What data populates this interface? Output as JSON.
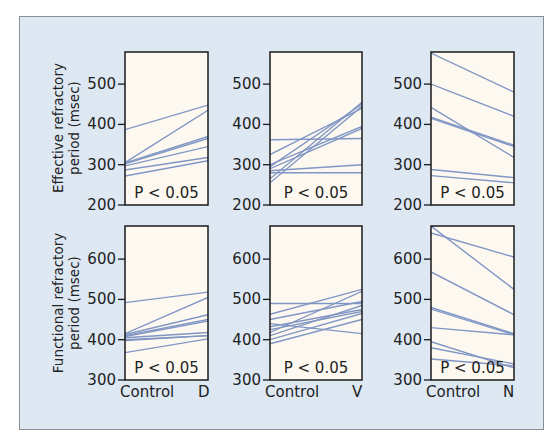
{
  "chart_data": [
    {
      "type": "line",
      "panel": "top-left",
      "ylabel": "Effective refractory period (msec)",
      "xlabel": "",
      "categories": [
        "Control",
        "D"
      ],
      "yticks": [
        200,
        300,
        400,
        500
      ],
      "ylim": [
        200,
        577
      ],
      "annotation": "P < 0.05",
      "series": [
        {
          "values": [
            387,
            448
          ]
        },
        {
          "values": [
            305,
            435
          ]
        },
        {
          "values": [
            304,
            370
          ]
        },
        {
          "values": [
            302,
            365
          ]
        },
        {
          "values": [
            297,
            345
          ]
        },
        {
          "values": [
            287,
            318
          ]
        },
        {
          "values": [
            272,
            310
          ]
        }
      ]
    },
    {
      "type": "line",
      "panel": "top-middle",
      "ylabel": "",
      "categories": [
        "Control",
        "V"
      ],
      "yticks": [
        200,
        300,
        400,
        500
      ],
      "ylim": [
        200,
        577
      ],
      "annotation": "P < 0.05",
      "series": [
        {
          "values": [
            362,
            365
          ]
        },
        {
          "values": [
            325,
            440
          ]
        },
        {
          "values": [
            295,
            450
          ]
        },
        {
          "values": [
            290,
            390
          ]
        },
        {
          "values": [
            285,
            300
          ]
        },
        {
          "values": [
            280,
            280
          ]
        },
        {
          "values": [
            265,
            455
          ]
        },
        {
          "values": [
            255,
            445
          ]
        },
        {
          "values": [
            300,
            395
          ]
        }
      ]
    },
    {
      "type": "line",
      "panel": "top-right",
      "ylabel": "",
      "categories": [
        "Control",
        "N"
      ],
      "yticks": [
        200,
        300,
        400,
        500
      ],
      "ylim": [
        200,
        577
      ],
      "annotation": "P < 0.05",
      "series": [
        {
          "values": [
            577,
            480
          ]
        },
        {
          "values": [
            500,
            420
          ]
        },
        {
          "values": [
            442,
            318
          ]
        },
        {
          "values": [
            418,
            348
          ]
        },
        {
          "values": [
            415,
            345
          ]
        },
        {
          "values": [
            288,
            268
          ]
        },
        {
          "values": [
            273,
            255
          ]
        }
      ]
    },
    {
      "type": "line",
      "panel": "bottom-left",
      "ylabel": "Functional refractory period (msec)",
      "xlabel": "",
      "categories": [
        "Control",
        "D"
      ],
      "yticks": [
        300,
        400,
        500,
        600
      ],
      "ylim": [
        300,
        682
      ],
      "annotation": "P < 0.05",
      "series": [
        {
          "values": [
            492,
            518
          ]
        },
        {
          "values": [
            415,
            505
          ]
        },
        {
          "values": [
            413,
            462
          ]
        },
        {
          "values": [
            410,
            450
          ]
        },
        {
          "values": [
            408,
            446
          ]
        },
        {
          "values": [
            405,
            418
          ]
        },
        {
          "values": [
            400,
            410
          ]
        },
        {
          "values": [
            398,
            410
          ]
        },
        {
          "values": [
            368,
            402
          ]
        }
      ]
    },
    {
      "type": "line",
      "panel": "bottom-middle",
      "ylabel": "",
      "categories": [
        "Control",
        "V"
      ],
      "yticks": [
        300,
        400,
        500,
        600
      ],
      "ylim": [
        300,
        682
      ],
      "annotation": "P < 0.05",
      "series": [
        {
          "values": [
            490,
            490
          ]
        },
        {
          "values": [
            463,
            525
          ]
        },
        {
          "values": [
            450,
            495
          ]
        },
        {
          "values": [
            440,
            415
          ]
        },
        {
          "values": [
            432,
            475
          ]
        },
        {
          "values": [
            425,
            470
          ]
        },
        {
          "values": [
            418,
            520
          ]
        },
        {
          "values": [
            410,
            485
          ]
        },
        {
          "values": [
            400,
            465
          ]
        },
        {
          "values": [
            390,
            450
          ]
        }
      ]
    },
    {
      "type": "line",
      "panel": "bottom-right",
      "ylabel": "",
      "categories": [
        "Control",
        "N"
      ],
      "yticks": [
        300,
        400,
        500,
        600
      ],
      "ylim": [
        300,
        682
      ],
      "annotation": "P < 0.05",
      "series": [
        {
          "values": [
            682,
            525
          ]
        },
        {
          "values": [
            665,
            605
          ]
        },
        {
          "values": [
            568,
            462
          ]
        },
        {
          "values": [
            480,
            415
          ]
        },
        {
          "values": [
            476,
            412
          ]
        },
        {
          "values": [
            430,
            412
          ]
        },
        {
          "values": [
            395,
            330
          ]
        },
        {
          "values": [
            380,
            340
          ]
        },
        {
          "values": [
            352,
            335
          ]
        }
      ]
    }
  ],
  "labels": {
    "row1_ylabel_line1": "Effective refractory",
    "row1_ylabel_line2": "period (msec)",
    "row2_ylabel_line1": "Functional refractory",
    "row2_ylabel_line2": "period (msec)",
    "pvalue": "P < 0.05",
    "x_control": "Control",
    "x_D": "D",
    "x_V": "V",
    "x_N": "N",
    "row1_ticks": [
      "500",
      "400",
      "300",
      "200"
    ],
    "row2_ticks": [
      "600",
      "500",
      "400",
      "300"
    ]
  },
  "colors": {
    "background": "#dde8f3",
    "plot_fill": "#fdf9f1",
    "line": "#8096c4",
    "axis": "#1a1a1a"
  }
}
